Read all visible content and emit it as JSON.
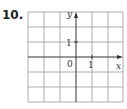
{
  "problem": {
    "number": "10."
  },
  "grid": {
    "columns": 6,
    "rows": 6,
    "line_color": "#999999",
    "axis_color": "#333333"
  },
  "axes": {
    "x_label": "x",
    "y_label": "y",
    "origin_label": "0",
    "x_tick_label": "1",
    "y_tick_label": "1"
  }
}
